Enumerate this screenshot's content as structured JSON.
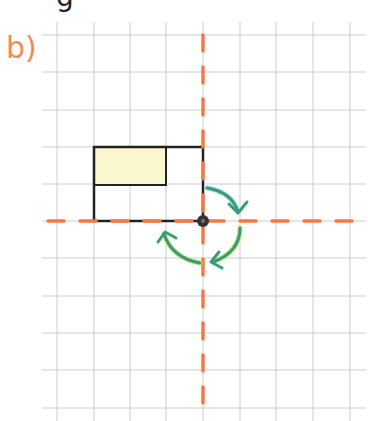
{
  "exercise": {
    "part_label": "b)",
    "top_partial_text": "g"
  },
  "grid": {
    "cell_size_px": 36.7,
    "line_color": "#c9ccd3",
    "cols_x": [
      57,
      94,
      130,
      166,
      203,
      240,
      276,
      313,
      350
    ],
    "rows_y": [
      35,
      72,
      110,
      147,
      184,
      221,
      258,
      296,
      333,
      370,
      408
    ]
  },
  "axes": {
    "color": "#ef7a4a",
    "style": "dashed",
    "horizontal_y": 221,
    "vertical_x": 203
  },
  "shapes": {
    "outer_rectangle": {
      "x": 94,
      "y": 147,
      "w": 109,
      "h": 74,
      "stroke": "#222222"
    },
    "shaded_rectangle": {
      "x": 94,
      "y": 147,
      "w": 72,
      "h": 38,
      "fill": "#fbf8cf",
      "stroke": "#222222"
    },
    "rotation_center": {
      "x": 203,
      "y": 221,
      "color": "#333333"
    }
  },
  "rotation_arrows": {
    "color": "#3a9a7a",
    "highlight": "#9fe0e8",
    "direction": "clockwise",
    "count": 3
  }
}
